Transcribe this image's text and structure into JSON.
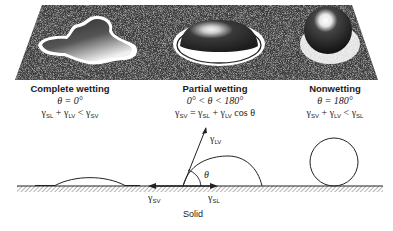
{
  "figure": {
    "panels": [
      {
        "id": "complete",
        "title": "Complete wetting",
        "angle": "θ = 0°",
        "relation_parts": {
          "a": "γ",
          "a_sub": "SL",
          "op1": " + ",
          "b": "γ",
          "b_sub": "LV",
          "op2": " < ",
          "c": "γ",
          "c_sub": "SV"
        }
      },
      {
        "id": "partial",
        "title": "Partial wetting",
        "angle": "0° < θ < 180°",
        "relation_parts": {
          "a": "γ",
          "a_sub": "SV",
          "op1": " = ",
          "b": "γ",
          "b_sub": "SL",
          "op2": " + ",
          "c": "γ",
          "c_sub": "LV",
          "tail": " cos θ"
        }
      },
      {
        "id": "nonwetting",
        "title": "Nonwetting",
        "angle": "θ = 180°",
        "relation_parts": {
          "a": "γ",
          "a_sub": "SV",
          "op1": " + ",
          "b": "γ",
          "b_sub": "LV",
          "op2": " < ",
          "c": "γ",
          "c_sub": "SL"
        }
      }
    ],
    "vectors": {
      "lv": {
        "sym": "γ",
        "sub": "LV"
      },
      "sv": {
        "sym": "γ",
        "sub": "SV"
      },
      "sl": {
        "sym": "γ",
        "sub": "SL"
      },
      "theta": "θ"
    },
    "solid_label": "Solid",
    "colors": {
      "ink": "#1a1a1a",
      "plate_dark": "#2b2b2b",
      "plate_light": "#9a9a9a",
      "background": "#ffffff"
    }
  }
}
